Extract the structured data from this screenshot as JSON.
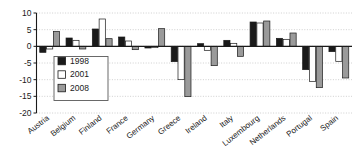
{
  "chart_data": {
    "type": "bar",
    "title": "",
    "xlabel": "",
    "ylabel": "",
    "ylim": [
      -20,
      10
    ],
    "yticks": [
      10,
      5,
      0,
      -5,
      -10,
      -15,
      -20
    ],
    "ytick_labels": [
      "10",
      "5",
      "0",
      "-5",
      "-10",
      "-15",
      "-20"
    ],
    "grid": true,
    "grid_axis": "y",
    "legend_position": "inside-left",
    "zero_line": 0,
    "categories": [
      "Austria",
      "Belgium",
      "Finland",
      "France",
      "Germany",
      "Greece",
      "Ireland",
      "Italy",
      "Luxembourg",
      "Netherlands",
      "Portugal",
      "Spain"
    ],
    "series": [
      {
        "name": "1998",
        "color": "#1a1a1a",
        "values": [
          -1.8,
          2.5,
          5.2,
          2.8,
          -0.5,
          -4.6,
          0.8,
          1.8,
          7.3,
          2.4,
          -7.0,
          -1.6
        ]
      },
      {
        "name": "2001",
        "color": "#ffffff",
        "values": [
          -0.8,
          1.8,
          8.2,
          1.6,
          -0.4,
          -10.0,
          -1.2,
          0.9,
          7.0,
          2.1,
          -10.5,
          -4.5
        ]
      },
      {
        "name": "2008",
        "color": "#9a9a9a",
        "values": [
          4.5,
          -0.8,
          2.3,
          -1.0,
          5.3,
          -15.1,
          -5.8,
          -3.0,
          7.6,
          4.0,
          -12.4,
          -9.5
        ]
      }
    ]
  },
  "legend": {
    "entries": [
      {
        "label": "1998",
        "swatch": "#1a1a1a"
      },
      {
        "label": "2001",
        "swatch": "#ffffff"
      },
      {
        "label": "2008",
        "swatch": "#9a9a9a"
      }
    ]
  },
  "axis": {
    "y_tick_0": "10",
    "y_tick_1": "5",
    "y_tick_2": "0",
    "y_tick_3": "-5",
    "y_tick_4": "-10",
    "y_tick_5": "-15",
    "y_tick_6": "-20"
  }
}
